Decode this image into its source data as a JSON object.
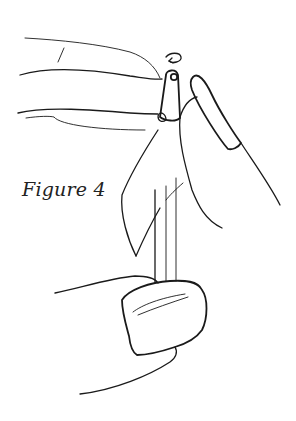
{
  "figure": {
    "caption": "Figure 4",
    "ink_color": "#1a1a1a",
    "background": "#ffffff"
  },
  "illustration": {
    "elements": [
      "left-hand-upper-fingers",
      "rotation-arrow",
      "bead-cap",
      "right-index-finger",
      "pin-wire",
      "thumb-with-nail"
    ]
  }
}
